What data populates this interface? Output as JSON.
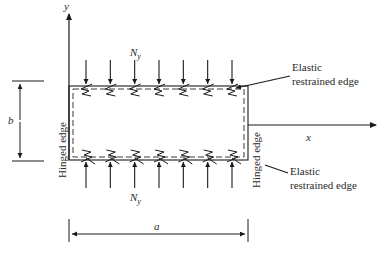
{
  "diagram": {
    "axes": {
      "x_label": "x",
      "y_label": "y"
    },
    "load_label_top": {
      "main": "N",
      "sub": "y"
    },
    "load_label_bottom": {
      "main": "N",
      "sub": "y"
    },
    "load_arrow_count": 7,
    "dimensions": {
      "width_label": "a",
      "height_label": "b"
    },
    "edges": {
      "left": "Hinged edge",
      "right": "Hinged edge",
      "top_line1": "Elastic",
      "top_line2": "restrained edge",
      "bottom_line1": "Elastic",
      "bottom_line2": "restrained edge"
    },
    "colors": {
      "line": "#1a1a1a",
      "dashed": "#3a3a3a",
      "text": "#2a2a2a"
    }
  }
}
